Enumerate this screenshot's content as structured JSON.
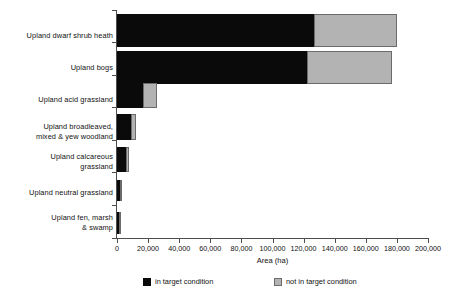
{
  "chart_data": {
    "type": "bar",
    "orientation": "horizontal",
    "stacked": true,
    "title": "",
    "xlabel": "Area (ha)",
    "ylabel": "",
    "xlim": [
      0,
      200000
    ],
    "xticks": [
      0,
      20000,
      40000,
      60000,
      80000,
      100000,
      120000,
      140000,
      160000,
      180000,
      200000
    ],
    "xtick_labels": [
      "0",
      "20,000",
      "40,000",
      "60,000",
      "80,000",
      "100,000",
      "120,000",
      "140,000",
      "160,000",
      "180,000",
      "200,000"
    ],
    "grid": false,
    "legend_position": "bottom",
    "categories": [
      "Upland dwarf shrub heath",
      "Upland bogs",
      "Upland acid grassland",
      "Upland broadleaved, mixed & yew woodland",
      "Upland calcareous grassland",
      "Upland neutral grassland",
      "Upland fen, marsh & swamp"
    ],
    "series": [
      {
        "name": "in target condition",
        "color": "#0a0a0a",
        "values": [
          127000,
          122000,
          17000,
          9000,
          6000,
          2000,
          1200
        ]
      },
      {
        "name": "not in target condition",
        "color": "#b3b3b3",
        "values": [
          53000,
          55000,
          9000,
          3000,
          1500,
          300,
          300
        ]
      }
    ],
    "totals": [
      180000,
      177000,
      26000,
      12000,
      7500,
      2300,
      1500
    ]
  },
  "categories_display": [
    {
      "lines": [
        "Upland dwarf shrub heath"
      ]
    },
    {
      "lines": [
        "Upland bogs"
      ]
    },
    {
      "lines": [
        "Upland acid grassland"
      ]
    },
    {
      "lines": [
        "Upland broadleaved,",
        "mixed & yew woodland"
      ]
    },
    {
      "lines": [
        "Upland calcareous",
        "grassland"
      ]
    },
    {
      "lines": [
        "Upland neutral grassland"
      ]
    },
    {
      "lines": [
        "Upland fen, marsh",
        "& swamp"
      ]
    }
  ],
  "legend": {
    "items": [
      {
        "label": "in target condition",
        "color": "#0a0a0a"
      },
      {
        "label": "not in target condition",
        "color": "#b3b3b3"
      }
    ]
  },
  "axis": {
    "x_title": "Area (ha)"
  }
}
